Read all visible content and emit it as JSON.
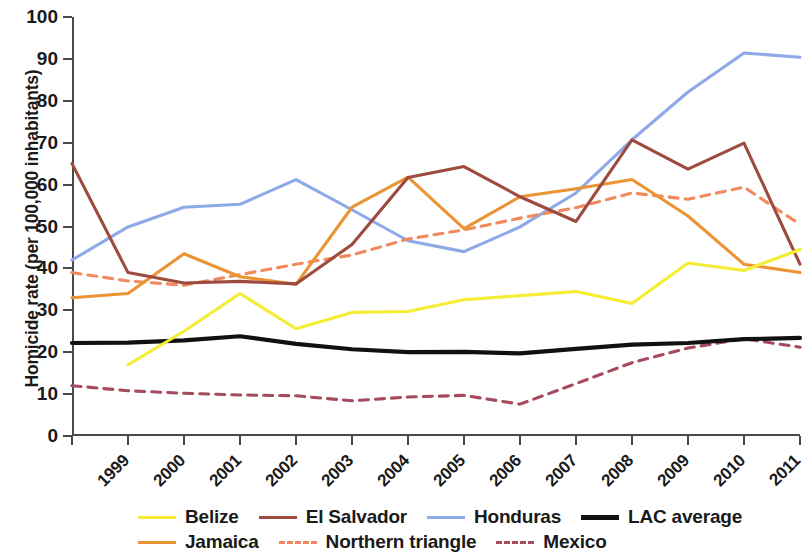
{
  "chart_data": {
    "type": "line",
    "title": "",
    "xlabel": "",
    "ylabel": "Homicide rate (per 100,000 inhabitants)",
    "x": [
      1999,
      2000,
      2001,
      2002,
      2003,
      2004,
      2005,
      2006,
      2007,
      2008,
      2009,
      2010,
      2011,
      2012
    ],
    "categories": [
      "1999",
      "2000",
      "2001",
      "2002",
      "2003",
      "2004",
      "2005",
      "2006",
      "2007",
      "2008",
      "2009",
      "2010",
      "2011",
      "2012"
    ],
    "xlim": [
      1999,
      2012
    ],
    "ylim": [
      0,
      100
    ],
    "yticks": [
      0,
      10,
      20,
      30,
      40,
      50,
      60,
      70,
      80,
      90,
      100
    ],
    "grid": false,
    "legend_position": "bottom",
    "series": [
      {
        "name": "Belize",
        "color": "#f5ed34",
        "style": "solid",
        "values": [
          null,
          17.0,
          25.0,
          34.0,
          25.6,
          29.5,
          29.7,
          32.5,
          33.5,
          34.5,
          31.6,
          41.3,
          39.5,
          44.5
        ]
      },
      {
        "name": "El Salvador",
        "color": "#9d4a3f",
        "style": "solid",
        "values": [
          65.0,
          39.0,
          36.5,
          36.9,
          36.3,
          45.7,
          61.7,
          64.3,
          57.1,
          51.2,
          70.7,
          63.7,
          69.9,
          41.0
        ]
      },
      {
        "name": "Honduras",
        "color": "#8ea9e8",
        "style": "solid",
        "values": [
          42.0,
          49.9,
          54.6,
          55.3,
          61.2,
          54.0,
          46.6,
          44.0,
          49.9,
          58.0,
          70.7,
          82.1,
          91.4,
          90.4
        ]
      },
      {
        "name": "LAC average",
        "color": "#111111",
        "style": "solid",
        "values": [
          22.2,
          22.3,
          22.8,
          23.8,
          22.0,
          20.7,
          20.0,
          20.1,
          19.7,
          20.8,
          21.8,
          22.2,
          23.1,
          23.4
        ]
      },
      {
        "name": "Jamaica",
        "color": "#eb9434",
        "style": "solid",
        "values": [
          33.0,
          34.0,
          43.5,
          38.0,
          36.2,
          54.6,
          61.8,
          49.5,
          57.1,
          59.0,
          61.2,
          52.5,
          41.0,
          39.0
        ]
      },
      {
        "name": "Northern triangle",
        "color": "#f08a5d",
        "style": "dashed",
        "values": [
          39.0,
          37.0,
          36.0,
          38.5,
          41.0,
          43.2,
          47.0,
          49.2,
          52.0,
          54.5,
          58.0,
          56.5,
          59.4,
          50.5
        ]
      },
      {
        "name": "Mexico",
        "color": "#a64a5e",
        "style": "dashed",
        "values": [
          12.0,
          10.8,
          10.2,
          9.8,
          9.6,
          8.4,
          9.3,
          9.7,
          7.6,
          12.5,
          17.5,
          21.0,
          23.2,
          21.2
        ]
      }
    ]
  },
  "legend": {
    "rows": [
      [
        "Belize",
        "El Salvador",
        "Honduras",
        "LAC average"
      ],
      [
        "Jamaica",
        "Northern triangle",
        "Mexico"
      ]
    ]
  }
}
